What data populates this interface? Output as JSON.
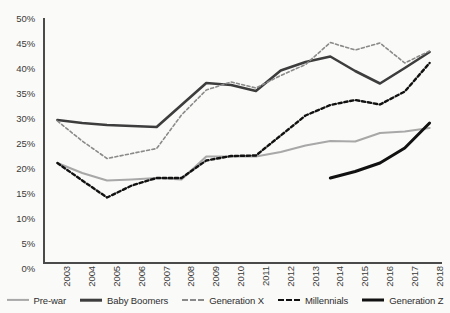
{
  "chart_data": {
    "type": "line",
    "title": "",
    "xlabel": "",
    "ylabel": "",
    "x": [
      "2003",
      "2004",
      "2005",
      "2006",
      "2007",
      "2008",
      "2009",
      "2010",
      "2011",
      "2012",
      "2013",
      "2014",
      "2015",
      "2016",
      "2017",
      "2018"
    ],
    "ylim": [
      0,
      50
    ],
    "y_ticks": [
      "0%",
      "5%",
      "10%",
      "15%",
      "20%",
      "25%",
      "30%",
      "35%",
      "40%",
      "45%",
      "50%"
    ],
    "y_tick_values": [
      0,
      5,
      10,
      15,
      20,
      25,
      30,
      35,
      40,
      45,
      50
    ],
    "grid": false,
    "legend_position": "bottom",
    "series": [
      {
        "name": "Pre-war",
        "color": "#a8a8a8",
        "style": "solid",
        "width": 2.2,
        "values": [
          21.0,
          19.0,
          17.5,
          17.7,
          18.0,
          17.7,
          22.3,
          22.3,
          22.3,
          23.2,
          24.5,
          25.4,
          25.3,
          27.0,
          27.3,
          28.0
        ]
      },
      {
        "name": "Baby Boomers",
        "color": "#3d3d3d",
        "style": "solid",
        "width": 2.6,
        "values": [
          29.6,
          29.0,
          28.6,
          28.4,
          28.2,
          32.6,
          37.0,
          36.6,
          35.4,
          39.5,
          41.2,
          42.3,
          39.4,
          36.9,
          40.0,
          43.2
        ]
      },
      {
        "name": "Generation X",
        "color": "#8a8a8a",
        "style": "fine-dash",
        "width": 1.6,
        "values": [
          29.4,
          25.4,
          21.9,
          22.9,
          23.9,
          30.6,
          35.6,
          37.2,
          36.0,
          38.5,
          40.7,
          45.1,
          43.6,
          45.0,
          41.0,
          43.4
        ]
      },
      {
        "name": "Millennials",
        "color": "#111111",
        "style": "dash",
        "width": 2.4,
        "values": [
          21.0,
          17.5,
          14.1,
          16.5,
          18.0,
          18.0,
          21.5,
          22.4,
          22.5,
          26.5,
          30.5,
          32.6,
          33.6,
          32.7,
          35.3,
          41.0
        ]
      },
      {
        "name": "Generation Z",
        "color": "#111111",
        "style": "solid",
        "width": 3.0,
        "values": [
          null,
          null,
          null,
          null,
          null,
          null,
          null,
          null,
          null,
          null,
          null,
          18.0,
          19.3,
          21.0,
          24.0,
          29.0
        ]
      }
    ]
  },
  "legend": {
    "items": [
      {
        "label": "Pre-war"
      },
      {
        "label": "Baby Boomers"
      },
      {
        "label": "Generation X"
      },
      {
        "label": "Millennials"
      },
      {
        "label": "Generation Z"
      }
    ]
  }
}
